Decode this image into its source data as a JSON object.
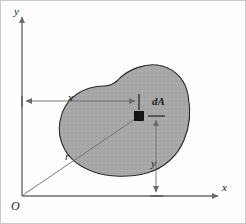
{
  "figure": {
    "width": 246,
    "height": 224,
    "background_color": "#fefefe",
    "frame_color": "#c9c9c9"
  },
  "axes": {
    "y_axis_label": "y",
    "x_axis_label": "x",
    "origin_label": "O",
    "axis_color": "#6b6b6b",
    "origin_px": {
      "x": 22,
      "y": 196
    },
    "x_axis_end_px": {
      "x": 218,
      "y": 196
    },
    "y_axis_top_px": {
      "x": 22,
      "y": 18
    }
  },
  "region": {
    "name": "shaded-area",
    "fill_color": "#a8a8a8",
    "stroke_color": "#2a2a2a",
    "description": "irregular closed plane area"
  },
  "element": {
    "label": "dA",
    "marker_color": "#151515",
    "marker_px": {
      "x": 139,
      "y": 116
    },
    "marker_size_px": 9
  },
  "dimensions": [
    {
      "name": "x-dimension",
      "label": "x",
      "orientation": "horizontal",
      "from_px": {
        "x": 22,
        "y": 101
      },
      "to_px": {
        "x": 139,
        "y": 101
      },
      "color": "#6b6b6b"
    },
    {
      "name": "y-dimension",
      "label": "y",
      "orientation": "vertical",
      "from_px": {
        "x": 156,
        "y": 116
      },
      "to_px": {
        "x": 156,
        "y": 196
      },
      "color": "#6b6b6b"
    },
    {
      "name": "radius",
      "label": "r",
      "orientation": "diagonal",
      "from_px": {
        "x": 22,
        "y": 196
      },
      "to_px": {
        "x": 139,
        "y": 116
      },
      "color": "#6b6b6b"
    }
  ],
  "colors": {
    "ink": "#1b1b1b",
    "shade": "#a8a8a8",
    "rule": "#6b6b6b",
    "frame": "#c9c9c9"
  }
}
